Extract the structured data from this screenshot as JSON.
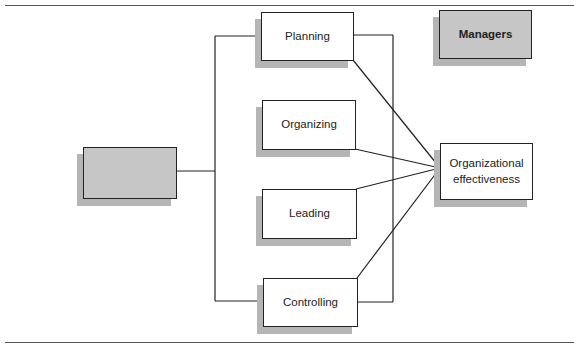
{
  "diagram": {
    "legend": {
      "label": "Managers",
      "fill": "#c6c6c6"
    },
    "source_box": {
      "label": "",
      "fill": "#c6c6c6"
    },
    "functions": [
      {
        "label": "Planning"
      },
      {
        "label": "Organizing"
      },
      {
        "label": "Leading"
      },
      {
        "label": "Controlling"
      }
    ],
    "outcome": {
      "label_line1": "Organizational",
      "label_line2": "effectiveness"
    },
    "colors": {
      "line": "#222222",
      "shadow": "#b5b5b5",
      "gray_fill": "#c6c6c6"
    }
  }
}
